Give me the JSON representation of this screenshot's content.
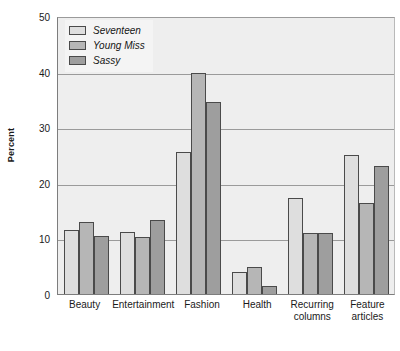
{
  "chart_data": {
    "type": "bar",
    "title": "",
    "subtitle": "",
    "xlabel": "",
    "ylabel": "Percent",
    "ylim": [
      0,
      50
    ],
    "yticks": [
      0,
      10,
      20,
      30,
      40,
      50
    ],
    "grid": true,
    "legend_position": "top-left",
    "categories": [
      "Beauty",
      "Entertainment",
      "Fashion",
      "Health",
      "Recurring columns",
      "Feature articles"
    ],
    "category_lines": [
      [
        "Beauty"
      ],
      [
        "Entertainment"
      ],
      [
        "Fashion"
      ],
      [
        "Health"
      ],
      [
        "Recurring",
        "columns"
      ],
      [
        "Feature",
        "articles"
      ]
    ],
    "series": [
      {
        "name": "Seventeen",
        "color": "#dedede",
        "values": [
          11.5,
          11.2,
          25.6,
          3.9,
          17.3,
          25.0
        ]
      },
      {
        "name": "Young Miss",
        "color": "#b6b6b6",
        "values": [
          12.9,
          10.2,
          39.8,
          4.8,
          11.0,
          16.4
        ]
      },
      {
        "name": "Sassy",
        "color": "#9e9e9e",
        "values": [
          10.5,
          13.4,
          34.5,
          1.5,
          11.0,
          23.0
        ]
      }
    ]
  },
  "figure": {
    "background_color": "#ffffff",
    "plot_background_color": "#eeeeee",
    "gridline_color": "#9a9a9a",
    "axis_color": "#7d7d7d",
    "bar_edge_color": "#4a4a4a"
  }
}
